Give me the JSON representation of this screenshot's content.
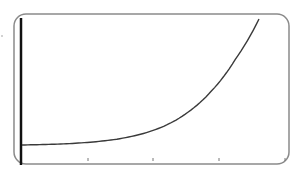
{
  "chart_data": {
    "type": "line",
    "title": "",
    "xlabel": "",
    "ylabel": "",
    "grid": false,
    "legend": null,
    "x_ticks": [
      "",
      "",
      "",
      ""
    ],
    "series": [
      {
        "name": "exponential-curve",
        "x": [
          0,
          0.5,
          1,
          1.5,
          2,
          2.5,
          3,
          3.5,
          4,
          4.5,
          5
        ],
        "y": [
          0.0,
          0.004,
          0.011,
          0.024,
          0.046,
          0.085,
          0.15,
          0.26,
          0.43,
          0.68,
          1.0
        ]
      }
    ],
    "colors": {
      "curve": "#3a3a3a",
      "axis": "#111111",
      "frame": "#8a8a8a"
    }
  }
}
